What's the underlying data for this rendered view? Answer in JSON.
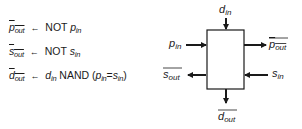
{
  "equations": [
    {
      "lhs": {
        "base": "p",
        "sub": "out",
        "negated": true
      },
      "assign": "←",
      "rhs_text": "NOT",
      "rhs_var": {
        "base": "p",
        "sub": "in"
      }
    },
    {
      "lhs": {
        "base": "s",
        "sub": "out",
        "negated": true
      },
      "assign": "←",
      "rhs_text": "NOT",
      "rhs_var": {
        "base": "s",
        "sub": "in"
      }
    },
    {
      "lhs": {
        "base": "d",
        "sub": "out",
        "negated": true
      },
      "assign": "←",
      "rhs_var1": {
        "base": "d",
        "sub": "in"
      },
      "op": "NAND",
      "paren_open": "(",
      "cond_a": {
        "base": "p",
        "sub": "in"
      },
      "eq": "=",
      "cond_b": {
        "base": "s",
        "sub": "in"
      },
      "paren_close": ")"
    }
  ],
  "block": {
    "ports": {
      "top_in": {
        "base": "d",
        "sub": "in",
        "negated": false
      },
      "left_in": {
        "base": "p",
        "sub": "in",
        "negated": false
      },
      "right_out": {
        "base": "p",
        "sub": "out",
        "negated": true
      },
      "left_out": {
        "base": "s",
        "sub": "out",
        "negated": true
      },
      "right_in": {
        "base": "s",
        "sub": "in",
        "negated": false
      },
      "bottom_out": {
        "base": "d",
        "sub": "out",
        "negated": true
      }
    }
  },
  "colors": {
    "ink": "#1a1a1a",
    "background": "#ffffff"
  }
}
